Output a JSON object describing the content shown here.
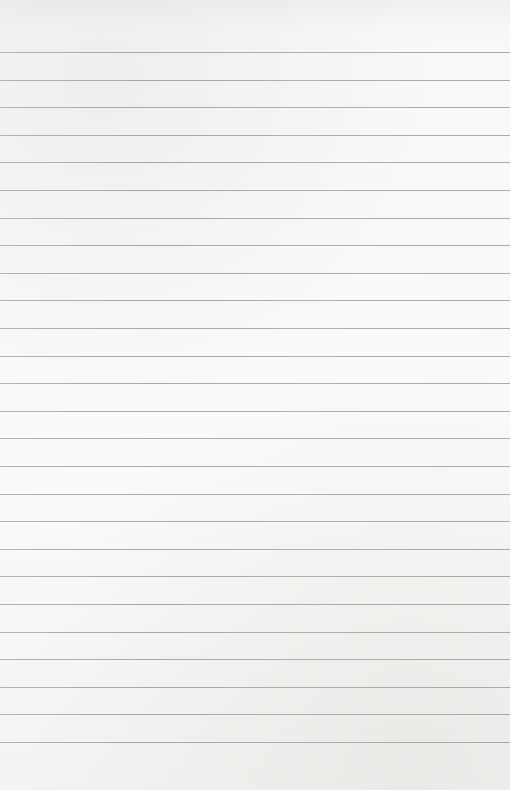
{
  "page": {
    "type": "blank-lined-paper",
    "background_color": "#f7f7f5",
    "rule_color": "#a0a0a0",
    "rule_count": 26,
    "first_rule_y": 52,
    "rule_spacing": 27.6,
    "text_content": []
  }
}
